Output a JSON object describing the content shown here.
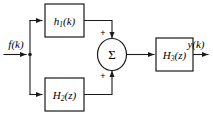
{
  "diagram": {
    "type": "signal-flow-block-diagram",
    "background_color": "#ffffff",
    "line_color": "#1a1a1a",
    "input": {
      "label": "f(k)",
      "label_base": "f",
      "label_arg": "(k)"
    },
    "output": {
      "label": "y(k)",
      "label_base": "y",
      "label_arg": "(k)"
    },
    "blocks": [
      {
        "id": "block-h1",
        "name": "h1-block",
        "base": "h",
        "subscript": "1",
        "arg": "(k)",
        "label": "h1(k)",
        "position": "top-left"
      },
      {
        "id": "block-h2",
        "name": "h2-block",
        "base": "H",
        "subscript": "2",
        "arg": "(z)",
        "label": "H2(z)",
        "position": "bottom-left"
      },
      {
        "id": "block-h3",
        "name": "h3-block",
        "base": "H",
        "subscript": "3",
        "arg": "(z)",
        "label": "H3(z)",
        "position": "right"
      }
    ],
    "summing_junction": {
      "id": "summing-junction",
      "symbol": "Σ",
      "top_sign": "+",
      "bottom_sign": "+"
    }
  }
}
